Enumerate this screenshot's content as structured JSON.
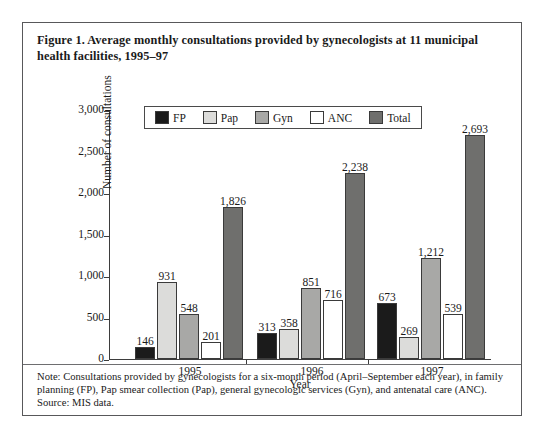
{
  "figure": {
    "caption": "Figure 1. Average monthly consultations provided by gynecologists at 11 municipal health facilities, 1995–97",
    "note": "Note: Consultations provided by gynecologists for a six-month period (April–September each year), in family planning (FP), Pap smear collection (Pap), general gynecologic services (Gyn), and antenatal care (ANC).",
    "source": "Source: MIS data."
  },
  "chart_data": {
    "type": "bar",
    "title": "Figure 1. Average monthly consultations provided by gynecologists at 11 municipal health facilities, 1995–97",
    "xlabel": "Year",
    "ylabel": "Number of consultations",
    "categories": [
      "1995",
      "1996",
      "1997"
    ],
    "ylim": [
      0,
      3000
    ],
    "yticks": [
      0,
      500,
      1000,
      1500,
      2000,
      2500,
      3000
    ],
    "ytick_labels": [
      "0",
      "500",
      "1,000",
      "1,500",
      "2,000",
      "2,500",
      "3,000"
    ],
    "grid": false,
    "legend_position": "top-center",
    "series": [
      {
        "name": "FP",
        "color": "#1b1b1b",
        "values": [
          146,
          313,
          673
        ],
        "labels": [
          "146",
          "313",
          "673"
        ]
      },
      {
        "name": "Pap",
        "color": "#dcdcda",
        "values": [
          931,
          358,
          269
        ],
        "labels": [
          "931",
          "358",
          "269"
        ]
      },
      {
        "name": "Gyn",
        "color": "#a8a8a6",
        "values": [
          548,
          851,
          1212
        ],
        "labels": [
          "548",
          "851",
          "1,212"
        ]
      },
      {
        "name": "ANC",
        "color": "#ffffff",
        "values": [
          201,
          716,
          539
        ],
        "labels": [
          "201",
          "716",
          "539"
        ]
      },
      {
        "name": "Total",
        "color": "#6f6f6d",
        "values": [
          1826,
          2238,
          2693
        ],
        "labels": [
          "1,826",
          "2,238",
          "2,693"
        ]
      }
    ]
  }
}
